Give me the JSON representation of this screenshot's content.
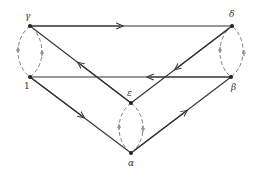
{
  "diagram": {
    "nodes": [
      {
        "id": "gamma",
        "label": "γ",
        "x": 30,
        "y": 26
      },
      {
        "id": "delta",
        "label": "δ",
        "x": 232,
        "y": 26
      },
      {
        "id": "one",
        "label": "1",
        "x": 30,
        "y": 77
      },
      {
        "id": "beta",
        "label": "β",
        "x": 231,
        "y": 77
      },
      {
        "id": "epsilon",
        "label": "ε",
        "x": 131,
        "y": 103
      },
      {
        "id": "alpha",
        "label": "α",
        "x": 131,
        "y": 153
      }
    ],
    "edges": [
      {
        "from": "gamma",
        "to": "delta",
        "style": "solid"
      },
      {
        "from": "beta",
        "to": "one",
        "style": "solid"
      },
      {
        "from": "epsilon",
        "to": "gamma",
        "style": "solid"
      },
      {
        "from": "delta",
        "to": "epsilon",
        "style": "solid"
      },
      {
        "from": "one",
        "to": "alpha",
        "style": "solid"
      },
      {
        "from": "alpha",
        "to": "beta",
        "style": "solid"
      },
      {
        "from": "gamma",
        "to": "one",
        "style": "dashed"
      },
      {
        "from": "one",
        "to": "gamma",
        "style": "dashed"
      },
      {
        "from": "delta",
        "to": "beta",
        "style": "dashed"
      },
      {
        "from": "beta",
        "to": "delta",
        "style": "dashed"
      },
      {
        "from": "epsilon",
        "to": "alpha",
        "style": "dashed"
      },
      {
        "from": "alpha",
        "to": "epsilon",
        "style": "dashed"
      }
    ]
  }
}
